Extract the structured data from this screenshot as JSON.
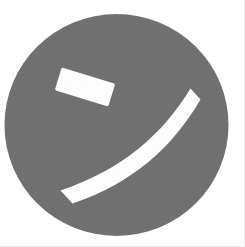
{
  "image": {
    "kind": "logo-mark",
    "description": "Stylized smiley face mark: solid gray circle with two white strokes",
    "width": 245,
    "height": 247,
    "background_color": "#ffffff"
  },
  "colors": {
    "background": "#ffffff",
    "disc": "#6e6e6e",
    "stroke": "#ffffff",
    "scan_edge": "#eaeaea"
  },
  "disc": {
    "name": "gray circle",
    "center_x": 116.5,
    "center_y": 125,
    "radius_x": 112,
    "radius_y": 111,
    "fill": "#6e6e6e"
  },
  "marks": [
    {
      "name": "eye-dash",
      "shape": "tilted rectangle bar",
      "fill": "#ffffff",
      "center_x": 85,
      "center_y": 87,
      "width": 56,
      "height": 24,
      "rotation_deg": 17
    },
    {
      "name": "smile-arc",
      "shape": "crescent arc band sweeping upper-right to lower-left",
      "fill": "#ffffff",
      "band_thickness": 21,
      "start_x": 190,
      "start_y": 92,
      "end_x": 62,
      "end_y": 193
    }
  ]
}
